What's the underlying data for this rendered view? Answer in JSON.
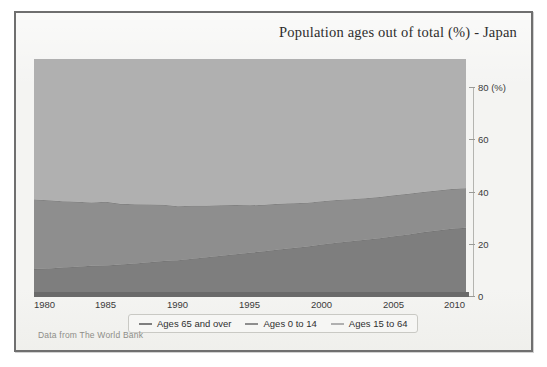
{
  "chart_data": {
    "type": "area",
    "stacked": true,
    "title": "Population ages out of total (%) - Japan",
    "subtitle": "",
    "source_note": "Data from The World Bank",
    "xlabel": "",
    "ylabel": "",
    "y_unit_label": "80 (%)",
    "grid": false,
    "legend_position": "bottom",
    "axis": {
      "y_side": "right",
      "ylim": [
        0,
        80
      ],
      "yticks": [
        0,
        20,
        40,
        60,
        80
      ],
      "ytick_labels": [
        "0",
        "20",
        "40",
        "60",
        "80 (%)"
      ],
      "xlim": [
        1980,
        2010
      ],
      "xticks": [
        1980,
        1985,
        1990,
        1995,
        2000,
        2005,
        2010
      ],
      "xtick_labels": [
        "1980",
        "1985",
        "1990",
        "1995",
        "2000",
        "2005",
        "2010"
      ]
    },
    "x": [
      1980,
      1981,
      1982,
      1983,
      1984,
      1985,
      1986,
      1987,
      1988,
      1989,
      1990,
      1991,
      1992,
      1993,
      1994,
      1995,
      1996,
      1997,
      1998,
      1999,
      2000,
      2001,
      2002,
      2003,
      2004,
      2005,
      2006,
      2007,
      2008,
      2009,
      2010
    ],
    "series": [
      {
        "name": "Ages 65 and over",
        "color": "#7e7e7e",
        "stack_order": 1,
        "values": [
          9.1,
          9.3,
          9.6,
          9.9,
          10.2,
          10.3,
          10.6,
          11.0,
          11.4,
          11.8,
          12.1,
          12.6,
          13.1,
          13.6,
          14.1,
          14.6,
          15.1,
          15.7,
          16.2,
          16.7,
          17.4,
          18.0,
          18.5,
          19.0,
          19.5,
          20.2,
          20.8,
          21.5,
          22.1,
          22.7,
          23.0
        ]
      },
      {
        "name": "Ages 0 to 14",
        "color": "#8e8e8e",
        "stack_order": 2,
        "values": [
          23.5,
          23.0,
          22.4,
          21.9,
          21.4,
          21.5,
          20.5,
          20.0,
          19.5,
          19.0,
          18.2,
          17.9,
          17.4,
          17.0,
          16.6,
          16.0,
          15.7,
          15.4,
          15.1,
          14.8,
          14.6,
          14.4,
          14.2,
          14.0,
          13.9,
          13.8,
          13.7,
          13.6,
          13.5,
          13.4,
          13.4
        ]
      },
      {
        "name": "Ages 15 to 64",
        "color": "#b0b0b0",
        "stack_order": 3,
        "values": [
          67.4,
          67.7,
          68.0,
          68.2,
          68.4,
          68.2,
          68.9,
          69.0,
          69.1,
          69.2,
          69.7,
          69.5,
          69.5,
          69.4,
          69.3,
          69.4,
          69.2,
          68.9,
          68.7,
          68.5,
          68.0,
          67.6,
          67.3,
          67.0,
          66.6,
          66.0,
          65.5,
          64.9,
          64.5,
          63.9,
          63.6
        ]
      }
    ],
    "cumulative_top_boundary": [
      67.4,
      67.7,
      68.0,
      68.2,
      68.4,
      68.2,
      68.9,
      69.0,
      69.1,
      69.2,
      69.7,
      69.5,
      69.5,
      69.4,
      69.3,
      69.4,
      69.2,
      68.9,
      68.7,
      68.5,
      68.0,
      67.6,
      67.3,
      67.0,
      66.6,
      66.0,
      65.5,
      64.9,
      64.5,
      63.9,
      63.6
    ]
  },
  "title": {
    "text": "Population ages out of total (%) - Japan"
  },
  "legend": {
    "items": [
      {
        "label": "Ages 65 and over",
        "color": "#7e7e7e"
      },
      {
        "label": "Ages 0 to 14",
        "color": "#8e8e8e"
      },
      {
        "label": "Ages 15 to 64",
        "color": "#b0b0b0"
      }
    ]
  },
  "footer": {
    "source": "Data from The World Bank"
  },
  "colors": {
    "band_65_and_over": "#7e7e7e",
    "band_0_to_14": "#8e8e8e",
    "band_15_to_64": "#b0b0b0",
    "frame": "#6f6f6f",
    "paper": "#f4f4f2",
    "axis": "#6a6a6a"
  }
}
